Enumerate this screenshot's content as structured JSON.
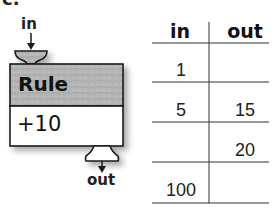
{
  "partial_label": "c.",
  "machine": {
    "input_label": "in",
    "output_label": "out",
    "rule_title": "Rule",
    "rule_operation": "+10",
    "colors": {
      "rule_fill": "#b8b8b8",
      "operation_fill": "#ffffff",
      "outline": "#1a1a1a"
    }
  },
  "table": {
    "headers": [
      "in",
      "out"
    ],
    "rows": [
      {
        "in": "1",
        "out": ""
      },
      {
        "in": "5",
        "out": "15"
      },
      {
        "in": "",
        "out": "20"
      },
      {
        "in": "100",
        "out": ""
      }
    ]
  }
}
